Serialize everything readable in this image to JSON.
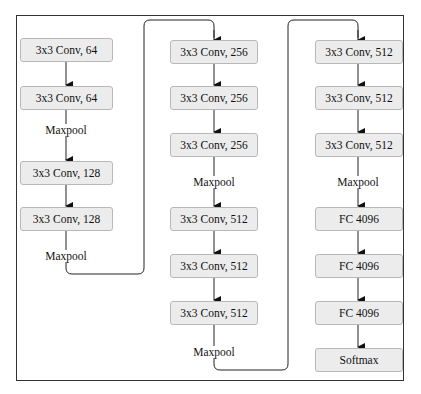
{
  "diagram": {
    "columns": [
      {
        "blocks": [
          {
            "label": "3x3 Conv, 64"
          },
          {
            "label": "3x3 Conv, 64"
          },
          {
            "label": "3x3 Conv, 128"
          },
          {
            "label": "3x3 Conv, 128"
          }
        ],
        "pool_labels": [
          "Maxpool",
          "Maxpool"
        ]
      },
      {
        "blocks": [
          {
            "label": "3x3 Conv, 256"
          },
          {
            "label": "3x3 Conv, 256"
          },
          {
            "label": "3x3 Conv, 256"
          },
          {
            "label": "3x3 Conv, 512"
          },
          {
            "label": "3x3 Conv, 512"
          },
          {
            "label": "3x3 Conv, 512"
          }
        ],
        "pool_labels": [
          "Maxpool",
          "Maxpool"
        ]
      },
      {
        "blocks": [
          {
            "label": "3x3 Conv, 512"
          },
          {
            "label": "3x3 Conv, 512"
          },
          {
            "label": "3x3 Conv, 512"
          },
          {
            "label": "FC 4096"
          },
          {
            "label": "FC 4096"
          },
          {
            "label": "FC 4096"
          },
          {
            "label": "Softmax"
          }
        ],
        "pool_labels": [
          "Maxpool"
        ]
      }
    ],
    "colors": {
      "box_fill": "#ececec",
      "box_border": "#b8b8b8",
      "line": "#222222",
      "frame": "#333333"
    }
  }
}
